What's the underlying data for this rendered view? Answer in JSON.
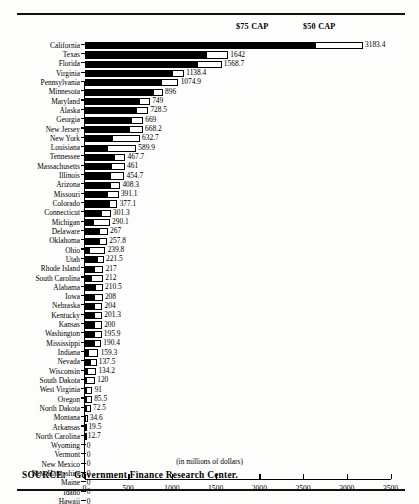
{
  "legend": {
    "cap75_label": "$75 CAP",
    "cap50_label": "$50 CAP"
  },
  "axis": {
    "title": "(in millions of dollars)",
    "ticks": [
      "0",
      "500",
      "1000",
      "1500",
      "2000",
      "2500",
      "3000",
      "3500"
    ]
  },
  "source": {
    "prefix": "SOURCE:",
    "text": "Government Finance Research Center."
  },
  "chart_data": {
    "type": "bar",
    "orientation": "horizontal",
    "title": "",
    "subtitle": "",
    "xlabel": "(in millions of dollars)",
    "ylabel": "",
    "xlim": [
      0,
      3500
    ],
    "xticks": [
      0,
      500,
      1000,
      1500,
      2000,
      2500,
      3000,
      3500
    ],
    "grid": false,
    "legend_position": "top",
    "legend_entries": [
      "$75 CAP",
      "$50 CAP"
    ],
    "note": "Each bar is stacked: a solid black segment showing the $75 CAP amount, and a white outlined segment extending to the total ($50 CAP amount). The number at the end of each bar is the total.",
    "categories": [
      "California",
      "Texas",
      "Florida",
      "Virginia",
      "Pennsylvania",
      "Minnesota",
      "Maryland",
      "Alaska",
      "Georgia",
      "New Jersey",
      "New York",
      "Louisiana",
      "Tennessee",
      "Massachusetts",
      "Illinois",
      "Arizona",
      "Missouri",
      "Colorado",
      "Connecticut",
      "Michigan",
      "Delaware",
      "Oklahoma",
      "Ohio",
      "Utah",
      "Rhode Island",
      "South Carolina",
      "Alabama",
      "Iowa",
      "Nebraska",
      "Kentucky",
      "Kansas",
      "Washington",
      "Mississippi",
      "Indiana",
      "Nevada",
      "Wisconsin",
      "South Dakota",
      "West Virginia",
      "Oregon",
      "North Dakota",
      "Montana",
      "Arkansas",
      "North Carolina",
      "Wyoming",
      "Vermont",
      "New Mexico",
      "New Hampshire",
      "Maine",
      "Idaho",
      "Hawaii"
    ],
    "values": [
      3183.4,
      1642,
      1568.7,
      1138.4,
      1074.9,
      896,
      749,
      728.5,
      669,
      668.2,
      632.7,
      589.9,
      467.7,
      461,
      454.7,
      408.3,
      391.1,
      377.1,
      301.3,
      290.1,
      267,
      257.8,
      239.8,
      221.5,
      217,
      212,
      210.5,
      208,
      204,
      201.3,
      200,
      195.9,
      190.4,
      159.3,
      137.5,
      134.2,
      120,
      91,
      85.5,
      72.5,
      34.6,
      19.5,
      12.7,
      0,
      0,
      0,
      0,
      0,
      0,
      0
    ],
    "value_labels": [
      "3183.4",
      "1642",
      "1568.7",
      "1138.4",
      "1074.9",
      "896",
      "749",
      "728.5",
      "669",
      "668.2",
      "632.7",
      "589.9",
      "467.7",
      "461",
      "454.7",
      "408.3",
      "391.1",
      "377.1",
      "301.3",
      "290.1",
      "267",
      "257.8",
      "239.8",
      "221.5",
      "217",
      "212",
      "210.5",
      "208",
      "204",
      "201.3",
      "200",
      "195.9",
      "190.4",
      "159.3",
      "137.5",
      "134.2",
      "120",
      "91",
      "85.5",
      "72.5",
      "34.6",
      "19.5",
      "12.7",
      "0",
      "0",
      "0",
      "0",
      "0",
      "0",
      "0"
    ],
    "series": [
      {
        "name": "$75 CAP",
        "values": [
          2650.0,
          1400.0,
          1300.0,
          1010.0,
          890.0,
          790.0,
          640.0,
          600.0,
          540.0,
          520.0,
          330.0,
          270.0,
          345.0,
          320.0,
          300.0,
          300.0,
          270.0,
          290.0,
          195.0,
          110.0,
          175.0,
          175.0,
          60.0,
          150.0,
          120.0,
          90.0,
          130.0,
          125.0,
          120.0,
          120.0,
          115.0,
          115.0,
          115.0,
          50.0,
          70.0,
          45.0,
          30.0,
          30.0,
          28.0,
          24.0,
          14.0,
          8.0,
          5.0,
          0,
          0,
          0,
          0,
          0,
          0,
          0
        ]
      },
      {
        "name": "$50 CAP",
        "values": [
          3183.4,
          1642,
          1568.7,
          1138.4,
          1074.9,
          896,
          749,
          728.5,
          669,
          668.2,
          632.7,
          589.9,
          467.7,
          461,
          454.7,
          408.3,
          391.1,
          377.1,
          301.3,
          290.1,
          267,
          257.8,
          239.8,
          221.5,
          217,
          212,
          210.5,
          208,
          204,
          201.3,
          200,
          195.9,
          190.4,
          159.3,
          137.5,
          134.2,
          120,
          91,
          85.5,
          72.5,
          34.6,
          19.5,
          12.7,
          0,
          0,
          0,
          0,
          0,
          0,
          0
        ]
      }
    ]
  }
}
